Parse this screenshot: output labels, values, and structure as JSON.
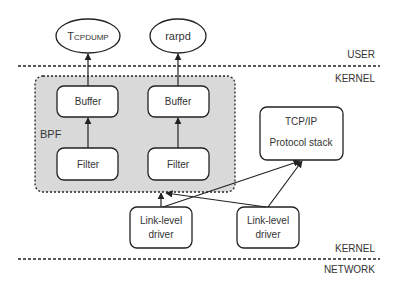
{
  "layers": {
    "user": "USER",
    "kernel_top": "KERNEL",
    "kernel_bottom": "KERNEL",
    "network": "NETWORK"
  },
  "processes": [
    {
      "id": "tcpdump",
      "label_first": "T",
      "label_rest": "CPDUMP"
    },
    {
      "id": "rarpd",
      "label": "rarpd"
    }
  ],
  "bpf": {
    "label": "BPF",
    "buffers": [
      "Buffer",
      "Buffer"
    ],
    "filters": [
      "Filter",
      "Filter"
    ]
  },
  "protocol_stack": {
    "line1": "TCP/IP",
    "line2": "Protocol stack"
  },
  "drivers": [
    {
      "line1": "Link-level",
      "line2": "driver"
    },
    {
      "line1": "Link-level",
      "line2": "driver"
    }
  ],
  "colors": {
    "bpf_fill": "#d9d9d9",
    "stroke": "#222222",
    "text": "#333333"
  }
}
